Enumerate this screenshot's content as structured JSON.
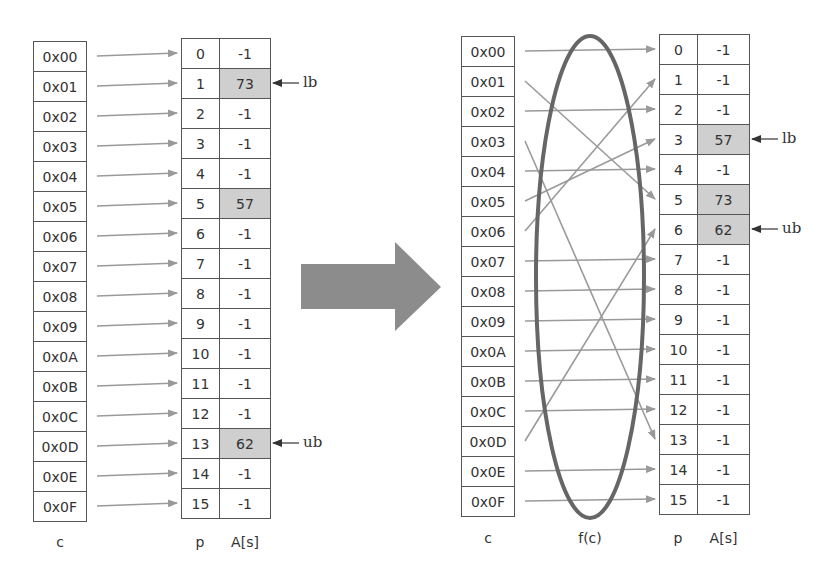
{
  "left": {
    "c_values": [
      "0x00",
      "0x01",
      "0x02",
      "0x03",
      "0x04",
      "0x05",
      "0x06",
      "0x07",
      "0x08",
      "0x09",
      "0x0A",
      "0x0B",
      "0x0C",
      "0x0D",
      "0x0E",
      "0x0F"
    ],
    "p_values": [
      "0",
      "1",
      "2",
      "3",
      "4",
      "5",
      "6",
      "7",
      "8",
      "9",
      "10",
      "11",
      "12",
      "13",
      "14",
      "15"
    ],
    "a_values": [
      "-1",
      "73",
      "-1",
      "-1",
      "-1",
      "57",
      "-1",
      "-1",
      "-1",
      "-1",
      "-1",
      "-1",
      "-1",
      "62",
      "-1",
      "-1"
    ],
    "highlighted": [
      1,
      5,
      13
    ],
    "mapping": [
      0,
      1,
      2,
      3,
      4,
      5,
      6,
      7,
      8,
      9,
      10,
      11,
      12,
      13,
      14,
      15
    ],
    "lb_row": 1,
    "ub_row": 13,
    "captions": {
      "c": "c",
      "p": "p",
      "a": "A[s]"
    }
  },
  "right": {
    "c_values": [
      "0x00",
      "0x01",
      "0x02",
      "0x03",
      "0x04",
      "0x05",
      "0x06",
      "0x07",
      "0x08",
      "0x09",
      "0x0A",
      "0x0B",
      "0x0C",
      "0x0D",
      "0x0E",
      "0x0F"
    ],
    "p_values": [
      "0",
      "1",
      "2",
      "3",
      "4",
      "5",
      "6",
      "7",
      "8",
      "9",
      "10",
      "11",
      "12",
      "13",
      "14",
      "15"
    ],
    "a_values": [
      "-1",
      "-1",
      "-1",
      "57",
      "-1",
      "73",
      "62",
      "-1",
      "-1",
      "-1",
      "-1",
      "-1",
      "-1",
      "-1",
      "-1",
      "-1"
    ],
    "highlighted": [
      3,
      5,
      6
    ],
    "mapping": [
      0,
      5,
      2,
      13,
      4,
      3,
      1,
      7,
      8,
      9,
      10,
      11,
      12,
      6,
      14,
      15
    ],
    "lb_row": 3,
    "ub_row": 6,
    "captions": {
      "c": "c",
      "f": "f(c)",
      "p": "p",
      "a": "A[s]"
    }
  },
  "labels": {
    "lb": "lb",
    "ub": "ub"
  },
  "colors": {
    "arrow": "#9a9a9a",
    "ellipse": "#666666",
    "highlight": "#cfcfcf",
    "big_arrow": "#8c8c8c"
  }
}
